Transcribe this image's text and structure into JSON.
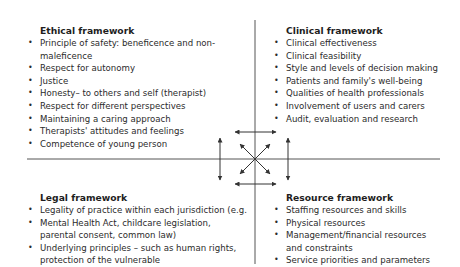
{
  "diagram": {
    "quadrants": [
      {
        "id": "ethical",
        "title": "Ethical framework",
        "items": [
          "Principle of safety: beneficence and non-",
          "maleficence",
          "Respect for autonomy",
          "Justice",
          "Honesty– to others and self (therapist)",
          "Respect for different perspectives",
          "Maintaining a caring approach",
          "Therapists' attitudes and feelings",
          "Competence of young person"
        ]
      },
      {
        "id": "clinical",
        "title": "Clinical framework",
        "items": [
          "Clinical effectiveness",
          "Clinical feasibility",
          "Style and levels of decision making",
          "Patients and family's well-being",
          "Qualities of health professionals",
          "Involvement of users and carers",
          "Audit, evaluation and research"
        ]
      },
      {
        "id": "legal",
        "title": "Legal framework",
        "items": [
          "Legality of practice within each jurisdiction (e.g.",
          "Mental Health Act, childcare legislation,",
          "parental consent, common law)",
          "Underlying principles – such as human rights,",
          "protection of the vulnerable"
        ]
      },
      {
        "id": "resource",
        "title": "Resource framework",
        "items": [
          "Staffing resources and skills",
          "Physical resources",
          "Management/financial resources",
          "and constraints",
          "Service priorities and parameters"
        ]
      }
    ],
    "colors": {
      "line": "#555555",
      "arrow": "#333333",
      "text": "#2b2b2b"
    }
  }
}
